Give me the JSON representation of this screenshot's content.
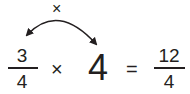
{
  "arc": {
    "operator": "×"
  },
  "expression": {
    "fraction_left": {
      "numerator": "3",
      "denominator": "4"
    },
    "times": "×",
    "whole": "4",
    "equals": "=",
    "fraction_result": {
      "numerator": "12",
      "denominator": "4"
    }
  },
  "colors": {
    "ink": "#231f20"
  }
}
